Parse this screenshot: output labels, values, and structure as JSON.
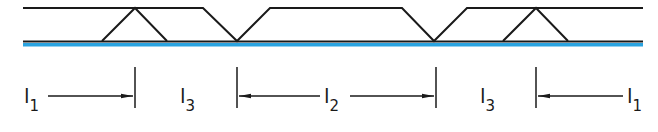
{
  "diagram": {
    "type": "weld-seam-joint-layout",
    "colors": {
      "line": "#1a1a1a",
      "substrate": "#2aa3e0",
      "background": "#ffffff"
    },
    "geometry": {
      "x_start": 23,
      "x_end": 643,
      "top_y": 8,
      "bottom_y": 41,
      "substrate_y": 44.5,
      "top_profile": [
        [
          23,
          8
        ],
        [
          135,
          8
        ],
        [
          203,
          8
        ],
        [
          237,
          41
        ],
        [
          270,
          8
        ],
        [
          402,
          8
        ],
        [
          434,
          41
        ],
        [
          467,
          8
        ],
        [
          536,
          8
        ],
        [
          643,
          8
        ]
      ],
      "triangles": [
        {
          "base_left": 102,
          "apex": 135,
          "base_right": 167
        },
        {
          "base_left": 503,
          "apex": 536,
          "base_right": 568
        }
      ],
      "ticks_x": [
        135,
        237,
        436,
        536
      ]
    },
    "dimensions": [
      {
        "id": "l1-left",
        "label": "l",
        "subscript": "1",
        "label_x": 26,
        "arrow_from": 48,
        "arrow_to": 133,
        "direction": "right"
      },
      {
        "id": "l3-left",
        "label": "l",
        "subscript": "3",
        "label_x": 181
      },
      {
        "id": "l2",
        "label": "l",
        "subscript": "2",
        "label_x": 325,
        "arrow_left_from": 320,
        "arrow_left_to": 239,
        "arrow_right_from": 350,
        "arrow_right_to": 434
      },
      {
        "id": "l3-right",
        "label": "l",
        "subscript": "3",
        "label_x": 481
      },
      {
        "id": "l1-right",
        "label": "l",
        "subscript": "1",
        "label_x": 628,
        "arrow_from": 623,
        "arrow_to": 538,
        "direction": "left"
      }
    ]
  }
}
